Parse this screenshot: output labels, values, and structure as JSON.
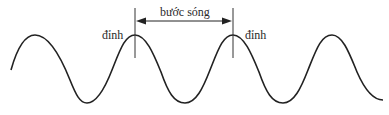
{
  "diagram": {
    "type": "sine-wave-wavelength",
    "labels": {
      "wavelength": "bước sóng",
      "crest_left": "đỉnh",
      "crest_right": "đỉnh"
    },
    "colors": {
      "line": "#222222",
      "text": "#2a2a2a",
      "background": "#ffffff"
    },
    "wave": {
      "peaks_x": [
        35,
        135,
        233,
        332
      ],
      "troughs_x": [
        85,
        185,
        283
      ],
      "peak_y": 35,
      "trough_y": 103
    }
  }
}
